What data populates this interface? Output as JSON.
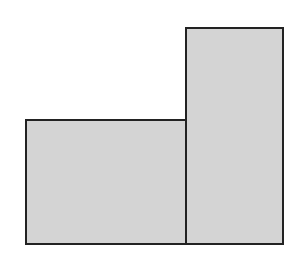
{
  "diagram": {
    "type": "composite-rectangles",
    "background": "#ffffff",
    "fill": "#d4d4d4",
    "stroke": "#222222",
    "stroke_width": 2,
    "shapes": [
      {
        "name": "short-rectangle",
        "x": 26,
        "y": 120,
        "width": 160,
        "height": 124
      },
      {
        "name": "tall-rectangle",
        "x": 186,
        "y": 28,
        "width": 97,
        "height": 216
      }
    ]
  }
}
